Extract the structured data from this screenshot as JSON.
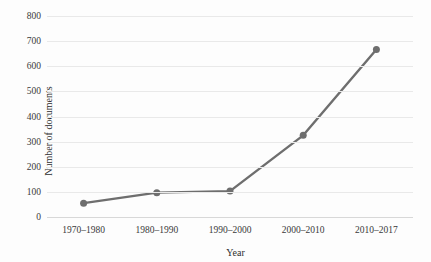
{
  "chart_data": {
    "type": "line",
    "title": "",
    "xlabel": "Year",
    "ylabel": "Number of documents",
    "categories": [
      "1970–1980",
      "1980–1990",
      "1990–2000",
      "2000–2010",
      "2010–2017"
    ],
    "values": [
      55,
      97,
      103,
      325,
      667
    ],
    "series": [
      {
        "name": "Number of documents",
        "values": [
          55,
          97,
          103,
          325,
          667
        ],
        "color": "#6e6e6e",
        "marker": "circle"
      }
    ],
    "ylim": [
      0,
      800
    ],
    "ytick_step": 100,
    "yticks": [
      0,
      100,
      200,
      300,
      400,
      500,
      600,
      700,
      800
    ],
    "ytick_labels": [
      "0",
      "100",
      "200",
      "300",
      "400",
      "500",
      "600",
      "700",
      "800"
    ],
    "grid": true,
    "grid_axis": "y",
    "grid_color": "#e9e9e9",
    "legend": false,
    "legend_position": "none",
    "background": "#ffffff",
    "line_color": "#6e6e6e",
    "line_width": 2.4,
    "marker_size": 6
  }
}
